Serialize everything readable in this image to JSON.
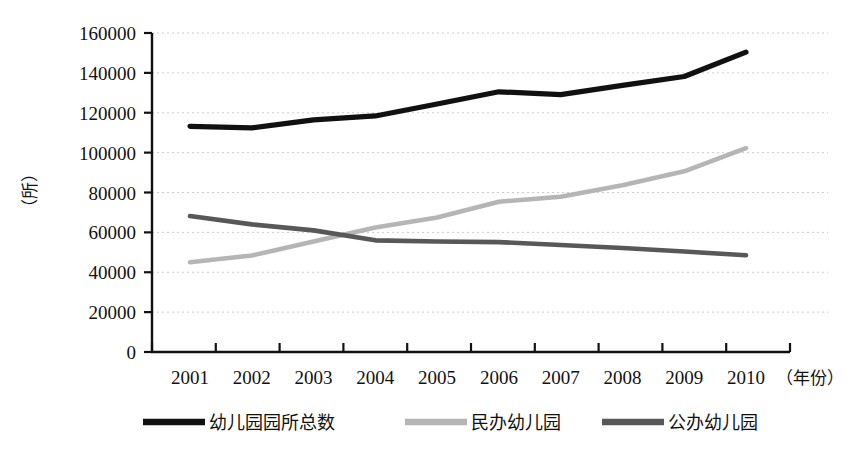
{
  "chart_data": {
    "type": "line",
    "title": "",
    "xlabel": "（年份）",
    "ylabel": "（所）",
    "categories": [
      "2001",
      "2002",
      "2003",
      "2004",
      "2005",
      "2006",
      "2007",
      "2008",
      "2009",
      "2010"
    ],
    "x": [
      2001,
      2002,
      2003,
      2004,
      2005,
      2006,
      2007,
      2008,
      2009,
      2010
    ],
    "ylim": [
      0,
      160000
    ],
    "yticks": [
      "0",
      "20000",
      "40000",
      "60000",
      "80000",
      "100000",
      "120000",
      "140000",
      "160000"
    ],
    "ytick_values": [
      0,
      20000,
      40000,
      60000,
      80000,
      100000,
      120000,
      140000,
      160000
    ],
    "grid": "horizontal-dotted",
    "legend_position": "bottom",
    "series": [
      {
        "name": "幼儿园园所总数",
        "color": "#111111",
        "values": [
          113200,
          112400,
          116400,
          118400,
          124400,
          130500,
          129100,
          133700,
          138200,
          150400
        ]
      },
      {
        "name": "民办幼儿园",
        "color": "#b5b5b5",
        "values": [
          45000,
          48400,
          55400,
          62400,
          67500,
          75400,
          77900,
          83600,
          90600,
          102300
        ]
      },
      {
        "name": "公办幼儿园",
        "color": "#585858",
        "values": [
          68200,
          64000,
          61000,
          56000,
          55400,
          55100,
          53700,
          52200,
          50400,
          48500
        ]
      }
    ]
  },
  "axes": {
    "y_caption": "（所）",
    "x_caption": "（年份）"
  },
  "legend": {
    "items": [
      {
        "label": "幼儿园园所总数",
        "color": "#111111",
        "style": "solid-thick"
      },
      {
        "label": "民办幼儿园",
        "color": "#b5b5b5",
        "style": "solid-thick"
      },
      {
        "label": "公办幼儿园",
        "color": "#585858",
        "style": "solid-thick"
      }
    ]
  }
}
